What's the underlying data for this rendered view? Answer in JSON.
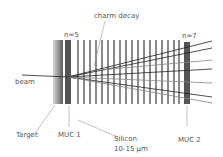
{
  "labels": {
    "charm_decay": "charm decay",
    "n5": "n=5",
    "n7": "n=7",
    "beam": "beam",
    "target": "Target",
    "muc1": "MUC 1",
    "silicon": "Silicon",
    "silicon_thickness": "10-15 μm",
    "muc2": "MUC 2"
  },
  "colors": {
    "line": "#222222",
    "strip": "#8a8a8a",
    "muc": "#555555",
    "label": "#555555"
  }
}
